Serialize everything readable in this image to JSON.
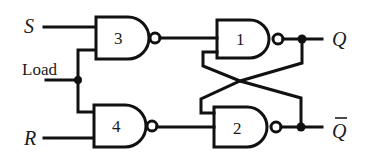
{
  "diagram": {
    "type": "gated SR latch (NAND)",
    "inputs": {
      "s": "S",
      "load": "Load",
      "r": "R"
    },
    "outputs": {
      "q": "Q",
      "q_bar": "Q"
    },
    "gates": [
      {
        "id": "3",
        "label": "3",
        "kind": "NAND"
      },
      {
        "id": "4",
        "label": "4",
        "kind": "NAND"
      },
      {
        "id": "1",
        "label": "1",
        "kind": "NAND"
      },
      {
        "id": "2",
        "label": "2",
        "kind": "NAND"
      }
    ],
    "connections": [
      {
        "from": "S",
        "to": "3"
      },
      {
        "from": "Load",
        "to": "3"
      },
      {
        "from": "Load",
        "to": "4"
      },
      {
        "from": "R",
        "to": "4"
      },
      {
        "from": "3",
        "to": "1"
      },
      {
        "from": "4",
        "to": "2"
      },
      {
        "from": "1",
        "to": "Q"
      },
      {
        "from": "2",
        "to": "Q_bar"
      },
      {
        "from": "1",
        "to": "2",
        "note": "cross-coupled feedback"
      },
      {
        "from": "2",
        "to": "1",
        "note": "cross-coupled feedback"
      }
    ],
    "colors": {
      "ink": "#111111",
      "background": "#ffffff"
    }
  }
}
